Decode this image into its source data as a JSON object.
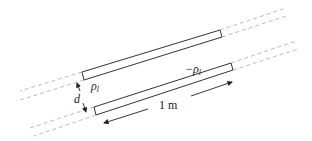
{
  "diagram": {
    "title": "",
    "labels": {
      "upper_charge": "ρ",
      "upper_charge_sub": "l",
      "lower_charge": "−ρ",
      "lower_charge_sub": "l",
      "separation": "d",
      "length": "1 m"
    },
    "elements": [
      {
        "id": "upper-wire",
        "kind": "segment (rectangle)",
        "charge_label": "ρl"
      },
      {
        "id": "lower-wire",
        "kind": "segment (rectangle)",
        "charge_label": "−ρl"
      },
      {
        "id": "separation-dimension",
        "label": "d"
      },
      {
        "id": "length-dimension",
        "label": "1 m"
      }
    ],
    "colors": {
      "stroke": "#333333",
      "dashed": "#aaaaaa",
      "background": "#ffffff"
    }
  }
}
